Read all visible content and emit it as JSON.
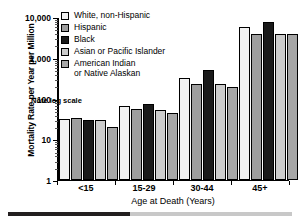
{
  "chart_data": {
    "type": "bar",
    "title": "",
    "xlabel": "Age at Death (Years)",
    "ylabel": "Mortality Rate per Year per Million",
    "categories": [
      "<15",
      "15-29",
      "30-44",
      "45+"
    ],
    "scale": "log",
    "ylim": [
      1,
      10000
    ],
    "ytick_labels": [
      "1",
      "10",
      "100",
      "1,000",
      "10,000"
    ],
    "ytick_values": [
      1,
      10,
      100,
      1000,
      10000
    ],
    "grid": false,
    "legend_position": "top-left-inside",
    "annotation": "Note log scale",
    "series": [
      {
        "name": "White, non-Hispanic",
        "color": "#f2f2f2",
        "values": [
          30,
          65,
          310,
          5500
        ]
      },
      {
        "name": "Hispanic",
        "color": "#9e9e9e",
        "values": [
          33,
          55,
          215,
          3700
        ]
      },
      {
        "name": "Black",
        "color": "#1a1a1a",
        "values": [
          29,
          72,
          490,
          7200
        ]
      },
      {
        "name": "Asian or Pacific Islander",
        "color": "#cccccc",
        "values": [
          29,
          52,
          225,
          3700
        ]
      },
      {
        "name": "American Indian\nor Native Alaskan",
        "color": "#a6a6a6",
        "values": [
          19,
          44,
          190,
          3700
        ]
      }
    ]
  },
  "footer": {
    "dark_fraction": 0.43,
    "dark_color": "#231f20",
    "light_color": "#c8c8c8"
  }
}
